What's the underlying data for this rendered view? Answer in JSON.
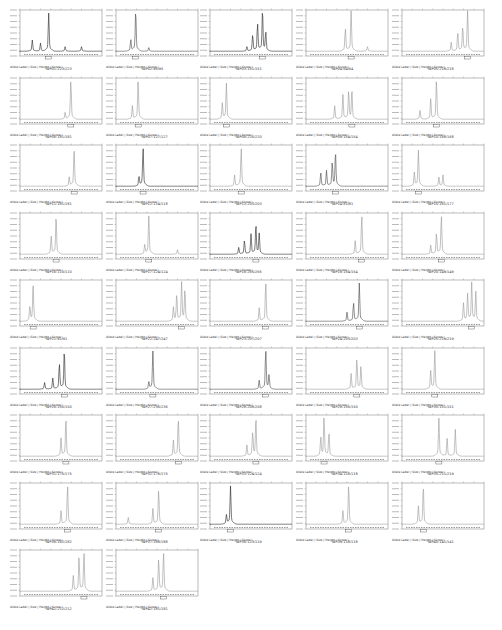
{
  "meta_label": "Allele Label | Size | Height | Score |",
  "chart_data": {
    "type": "line",
    "layout": {
      "columns": 5,
      "rows": 9,
      "grid": false
    },
    "panels": [
      {
        "label": "WP01:223/223",
        "peaks": [
          [
            0.15,
            0.25
          ],
          [
            0.25,
            0.18
          ],
          [
            0.35,
            0.85
          ],
          [
            0.55,
            0.1
          ],
          [
            0.75,
            0.1
          ]
        ],
        "color": "#222"
      },
      {
        "label": "WP02:95/95",
        "peaks": [
          [
            0.18,
            0.25
          ],
          [
            0.24,
            0.9
          ],
          [
            0.4,
            0.08
          ]
        ],
        "color": "#444"
      },
      {
        "label": "WP03:151/151",
        "peaks": [
          [
            0.45,
            0.1
          ],
          [
            0.52,
            0.35
          ],
          [
            0.58,
            0.6
          ],
          [
            0.64,
            0.9
          ],
          [
            0.68,
            0.4
          ]
        ],
        "color": "#222"
      },
      {
        "label": "WP04:64/64",
        "peaks": [
          [
            0.48,
            0.5
          ],
          [
            0.55,
            0.9
          ],
          [
            0.75,
            0.1
          ]
        ],
        "color": "#999"
      },
      {
        "label": "WP05:218/218",
        "peaks": [
          [
            0.6,
            0.2
          ],
          [
            0.68,
            0.4
          ],
          [
            0.74,
            0.55
          ],
          [
            0.8,
            0.9
          ]
        ],
        "color": "#999"
      },
      {
        "label": "WP06:181/181",
        "peaks": [
          [
            0.55,
            0.15
          ],
          [
            0.62,
            0.85
          ]
        ],
        "color": "#999"
      },
      {
        "label": "WP07:127/127",
        "peaks": [
          [
            0.2,
            0.3
          ],
          [
            0.27,
            0.85
          ]
        ],
        "color": "#999"
      },
      {
        "label": "WP08:220/220",
        "peaks": [
          [
            0.15,
            0.35
          ],
          [
            0.2,
            0.8
          ]
        ],
        "color": "#999"
      },
      {
        "label": "WP09:154/154",
        "peaks": [
          [
            0.35,
            0.3
          ],
          [
            0.45,
            0.55
          ],
          [
            0.52,
            0.6
          ],
          [
            0.56,
            0.65
          ]
        ],
        "color": "#999"
      },
      {
        "label": "WP10:168/168",
        "peaks": [
          [
            0.22,
            0.2
          ],
          [
            0.35,
            0.45
          ],
          [
            0.42,
            0.85
          ]
        ],
        "color": "#999"
      },
      {
        "label": "WP11:181/181",
        "peaks": [
          [
            0.6,
            0.2
          ],
          [
            0.66,
            0.85
          ]
        ],
        "color": "#999"
      },
      {
        "label": "WP12:114/118",
        "peaks": [
          [
            0.28,
            0.2
          ],
          [
            0.33,
            0.85
          ]
        ],
        "color": "#222"
      },
      {
        "label": "WP13:203/203",
        "peaks": [
          [
            0.3,
            0.25
          ],
          [
            0.38,
            0.85
          ]
        ],
        "color": "#999"
      },
      {
        "label": "WP14:81/81",
        "peaks": [
          [
            0.18,
            0.3
          ],
          [
            0.25,
            0.35
          ],
          [
            0.32,
            0.5
          ],
          [
            0.36,
            0.75
          ]
        ],
        "color": "#444"
      },
      {
        "label": "WP15:161/177",
        "peaks": [
          [
            0.15,
            0.3
          ],
          [
            0.2,
            0.8
          ],
          [
            0.45,
            0.2
          ],
          [
            0.5,
            0.25
          ]
        ],
        "color": "#999"
      },
      {
        "label": "WP16:110/110",
        "peaks": [
          [
            0.38,
            0.4
          ],
          [
            0.44,
            0.85
          ]
        ],
        "color": "#999"
      },
      {
        "label": "WP17:124/124",
        "peaks": [
          [
            0.35,
            0.2
          ],
          [
            0.4,
            0.85
          ],
          [
            0.75,
            0.1
          ]
        ],
        "color": "#999"
      },
      {
        "label": "WP18:265/265",
        "peaks": [
          [
            0.35,
            0.15
          ],
          [
            0.42,
            0.3
          ],
          [
            0.5,
            0.45
          ],
          [
            0.56,
            0.65
          ],
          [
            0.6,
            0.45
          ]
        ],
        "color": "#222"
      },
      {
        "label": "WP19:154/154",
        "peaks": [
          [
            0.6,
            0.3
          ],
          [
            0.68,
            0.85
          ]
        ],
        "color": "#999"
      },
      {
        "label": "WP20:149/149",
        "peaks": [
          [
            0.35,
            0.2
          ],
          [
            0.42,
            0.45
          ],
          [
            0.48,
            0.85
          ]
        ],
        "color": "#999"
      },
      {
        "label": "WP21:91/91",
        "peaks": [
          [
            0.12,
            0.3
          ],
          [
            0.16,
            0.85
          ]
        ],
        "color": "#999"
      },
      {
        "label": "WP22:247/247",
        "peaks": [
          [
            0.7,
            0.3
          ],
          [
            0.74,
            0.6
          ],
          [
            0.8,
            0.85
          ],
          [
            0.84,
            0.7
          ]
        ],
        "color": "#999"
      },
      {
        "label": "WP23:207/207",
        "peaks": [
          [
            0.6,
            0.3
          ],
          [
            0.68,
            0.85
          ]
        ],
        "color": "#999"
      },
      {
        "label": "WP24:203/203",
        "peaks": [
          [
            0.5,
            0.2
          ],
          [
            0.58,
            0.4
          ],
          [
            0.65,
            0.85
          ]
        ],
        "color": "#444"
      },
      {
        "label": "WP25:219/219",
        "peaks": [
          [
            0.75,
            0.4
          ],
          [
            0.8,
            0.6
          ],
          [
            0.85,
            0.85
          ],
          [
            0.9,
            0.65
          ]
        ],
        "color": "#999"
      },
      {
        "label": "WP26:150/150",
        "peaks": [
          [
            0.3,
            0.15
          ],
          [
            0.4,
            0.25
          ],
          [
            0.48,
            0.55
          ],
          [
            0.54,
            0.85
          ]
        ],
        "color": "#222"
      },
      {
        "label": "WP27:236/236",
        "peaks": [
          [
            0.4,
            0.15
          ],
          [
            0.45,
            0.85
          ]
        ],
        "color": "#444"
      },
      {
        "label": "WP28:208/208",
        "peaks": [
          [
            0.6,
            0.2
          ],
          [
            0.68,
            0.85
          ],
          [
            0.72,
            0.3
          ]
        ],
        "color": "#444"
      },
      {
        "label": "WP29:150/150",
        "peaks": [
          [
            0.55,
            0.35
          ],
          [
            0.62,
            0.65
          ],
          [
            0.67,
            0.5
          ]
        ],
        "color": "#999"
      },
      {
        "label": "WP30:151/151",
        "peaks": [
          [
            0.35,
            0.4
          ],
          [
            0.4,
            0.85
          ]
        ],
        "color": "#999"
      },
      {
        "label": "WP31:175/175",
        "peaks": [
          [
            0.5,
            0.4
          ],
          [
            0.56,
            0.85
          ]
        ],
        "color": "#999"
      },
      {
        "label": "WP32:176/176",
        "peaks": [
          [
            0.7,
            0.35
          ],
          [
            0.76,
            0.85
          ]
        ],
        "color": "#999"
      },
      {
        "label": "WP33:124/124",
        "peaks": [
          [
            0.45,
            0.25
          ],
          [
            0.52,
            0.5
          ],
          [
            0.56,
            0.85
          ]
        ],
        "color": "#999"
      },
      {
        "label": "WP34:118/118",
        "peaks": [
          [
            0.18,
            0.4
          ],
          [
            0.22,
            0.85
          ],
          [
            0.28,
            0.5
          ]
        ],
        "color": "#999"
      },
      {
        "label": "WP35:211/219",
        "peaks": [
          [
            0.45,
            0.85
          ],
          [
            0.55,
            0.4
          ],
          [
            0.65,
            0.6
          ]
        ],
        "color": "#999"
      },
      {
        "label": "WP36:182/182",
        "peaks": [
          [
            0.5,
            0.3
          ],
          [
            0.58,
            0.85
          ]
        ],
        "color": "#999"
      },
      {
        "label": "WP37:188/188",
        "peaks": [
          [
            0.15,
            0.15
          ],
          [
            0.45,
            0.35
          ],
          [
            0.52,
            0.75
          ]
        ],
        "color": "#999"
      },
      {
        "label": "WP38:123/119",
        "peaks": [
          [
            0.2,
            0.2
          ],
          [
            0.25,
            0.85
          ]
        ],
        "color": "#222"
      },
      {
        "label": "WP39:118/118",
        "peaks": [
          [
            0.45,
            0.3
          ],
          [
            0.52,
            0.85
          ]
        ],
        "color": "#999"
      },
      {
        "label": "WP40:141/141",
        "peaks": [
          [
            0.2,
            0.4
          ],
          [
            0.26,
            0.85
          ]
        ],
        "color": "#999"
      },
      {
        "label": "WP41:212/212",
        "peaks": [
          [
            0.65,
            0.35
          ],
          [
            0.72,
            0.75
          ],
          [
            0.78,
            0.85
          ]
        ],
        "color": "#999"
      },
      {
        "label": "WP42:181/181",
        "peaks": [
          [
            0.45,
            0.3
          ],
          [
            0.52,
            0.7
          ],
          [
            0.58,
            0.85
          ]
        ],
        "color": "#999"
      }
    ]
  }
}
